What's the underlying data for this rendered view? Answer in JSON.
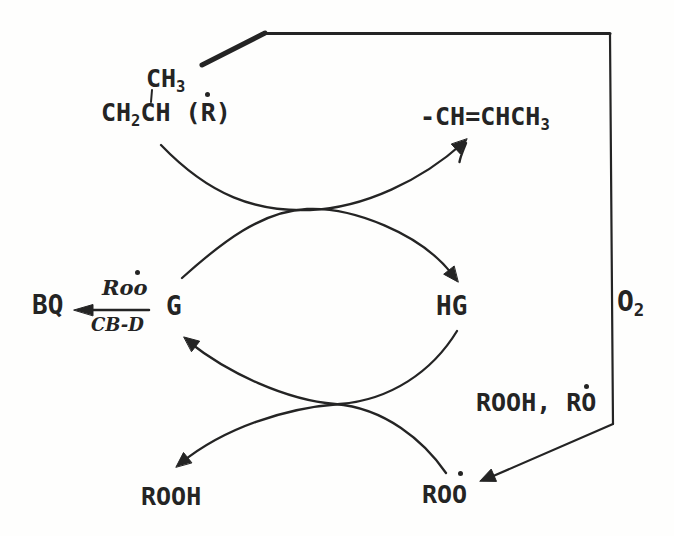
{
  "figure": {
    "type": "chemical-reaction-scheme",
    "background_color": "#fefefd",
    "ink_color": "#242424"
  },
  "species": {
    "methyl": {
      "text": "CH",
      "sub": "3"
    },
    "backbone": {
      "p1": "CH",
      "sub1": "2",
      "p2": "CH (R)"
    },
    "alkene": {
      "text": "-CH=CHCH",
      "sub": "3"
    },
    "bq": {
      "text": "BQ"
    },
    "g": {
      "text": "G"
    },
    "hg": {
      "text": "HG"
    },
    "oxygen": {
      "text": "O",
      "sub": "2"
    },
    "rooh_ro": {
      "text": "ROOH, RO"
    },
    "rooh": {
      "text": "ROOH"
    },
    "roo": {
      "text": "ROO"
    }
  },
  "bq_reaction": {
    "above_arrow": "Roo",
    "below_arrow": "CB-D"
  },
  "radical_dots": [
    {
      "marks": "R in CH2CH (R)"
    },
    {
      "marks": "Roo above BQ arrow"
    },
    {
      "marks": "O in RO"
    },
    {
      "marks": "last O in ROO"
    }
  ]
}
